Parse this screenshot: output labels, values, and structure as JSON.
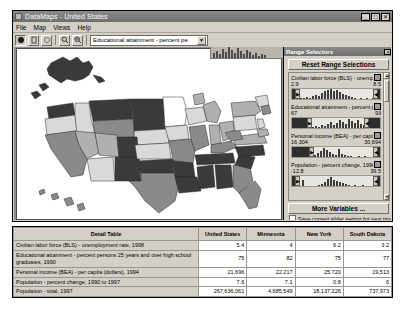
{
  "window": {
    "title": "DataMaps - United States",
    "icon": "app-icon",
    "buttons": {
      "minimize": "_",
      "maximize": "□",
      "close": "✕"
    }
  },
  "menubar": {
    "items": [
      "File",
      "Map",
      "Views",
      "Help"
    ]
  },
  "toolbar": {
    "buttons": [
      {
        "name": "pointer-tool",
        "glyph": "●"
      },
      {
        "name": "hand-tool",
        "glyph": "✋"
      },
      {
        "name": "circle-tool",
        "glyph": "◯"
      },
      {
        "name": "zoom-in-tool",
        "glyph": "🔍"
      },
      {
        "name": "zoom-out-tool",
        "glyph": "🔍"
      }
    ],
    "variable_combo": {
      "value": "Educational attainment - percent pe",
      "placeholder": "Select variable",
      "arrow": "▼"
    }
  },
  "range_selectors": {
    "title": "Range Selectors",
    "close_label": "✕",
    "reset_label": "Reset Range Selections",
    "more_variables_label": "More Variables ...",
    "save_checkbox_label": "Save current slider setting for next time use",
    "save_checkbox_checked": false,
    "items": [
      {
        "name": "Civilian labor force (BLS) - unemployment",
        "min": "2.9",
        "max": "8.5",
        "handle_left": "▶",
        "handle_right": "◀",
        "mask_left_pct": 2,
        "mask_right_pct": 4,
        "bars": [
          2,
          3,
          2,
          4,
          3,
          5,
          6,
          4,
          8,
          12,
          18,
          22,
          26,
          30,
          24,
          28,
          20,
          16,
          13,
          10,
          8,
          6,
          5,
          4,
          3,
          2,
          2,
          1,
          3,
          2,
          1,
          1,
          2,
          1
        ]
      },
      {
        "name": "Educational attainment - percent persons",
        "min": "67",
        "max": "93",
        "handle_left": "▶",
        "handle_right": "◀",
        "mask_left_pct": 16,
        "mask_right_pct": 12,
        "bars": [
          1,
          2,
          1,
          3,
          2,
          4,
          6,
          3,
          5,
          8,
          6,
          4,
          9,
          14,
          7,
          18,
          22,
          12,
          16,
          10,
          20,
          14,
          9,
          11,
          7,
          5,
          4,
          3,
          2,
          2,
          1,
          1,
          1,
          1
        ]
      },
      {
        "name": "Personal income (BEA) - per capita (dolla",
        "min": "16,304",
        "max": "30,694",
        "handle_left": "▶",
        "handle_right": "◀",
        "mask_left_pct": 18,
        "mask_right_pct": 4,
        "bars": [
          2,
          4,
          3,
          8,
          14,
          18,
          22,
          16,
          12,
          9,
          7,
          20,
          10,
          6,
          5,
          4,
          3,
          2,
          2,
          1,
          1,
          1,
          2,
          1,
          1,
          1,
          1,
          1,
          1,
          1,
          1,
          1,
          1,
          1
        ]
      },
      {
        "name": "Population - percent change, 1990 to 19",
        "min": "-12.8",
        "max": "39.5",
        "handle_left": "▶",
        "handle_right": "◀",
        "mask_left_pct": 3,
        "mask_right_pct": 4,
        "bars": [
          8,
          2,
          1,
          1,
          1,
          2,
          3,
          4,
          6,
          10,
          16,
          20,
          24,
          18,
          14,
          10,
          8,
          6,
          4,
          3,
          3,
          2,
          2,
          1,
          1,
          1,
          1,
          1,
          1,
          1,
          1,
          1,
          1,
          1
        ]
      }
    ],
    "scrollbar": {
      "up": "▲",
      "down": "▼"
    }
  },
  "map": {
    "name": "united-states-choropleth",
    "legend_shades": [
      "#ffffff",
      "#d9d9d9",
      "#b0b0b0",
      "#8a8a8a",
      "#3a3a3a"
    ]
  },
  "detail_table": {
    "columns": [
      "Detail Table",
      "United States",
      "Minnesota",
      "New York",
      "South Dakota"
    ],
    "rows": [
      {
        "label": "Civilian labor force (BLS) - unemployment rate, 1998",
        "values": [
          "5.4",
          "4",
          "6.2",
          "3.2"
        ]
      },
      {
        "label": "Educational attainment - percent persons 25 years and over high school graduates, 1990",
        "values": [
          "75",
          "82",
          "75",
          "77"
        ]
      },
      {
        "label": "Personal income (BEA) - per capita (dollars), 1994",
        "values": [
          "21,696",
          "22,217",
          "25,720",
          "19,513"
        ]
      },
      {
        "label": "Population - percent change, 1990 to 1997",
        "values": [
          "7.6",
          "7.1",
          "0.8",
          "6"
        ]
      },
      {
        "label": "Population - total, 1997",
        "values": [
          "267,636,061",
          "4,685,549",
          "18,137,226",
          "737,973"
        ]
      }
    ]
  }
}
